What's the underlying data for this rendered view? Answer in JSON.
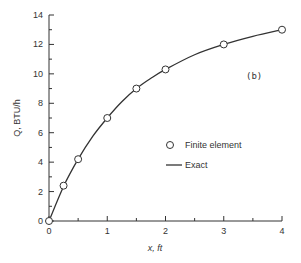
{
  "chart_data": {
    "type": "line",
    "title": "",
    "annotation": "(b)",
    "xlabel": "x, ft",
    "ylabel": "Q, BTU/h",
    "xlim": [
      0,
      4
    ],
    "ylim": [
      0,
      14
    ],
    "x_ticks": [
      0,
      1,
      2,
      3,
      4
    ],
    "x_minor_ticks": [
      0.5,
      1.5,
      2.5,
      3.5
    ],
    "y_ticks": [
      0,
      2,
      4,
      6,
      8,
      10,
      12,
      14
    ],
    "y_minor_ticks": [
      1,
      3,
      5,
      7,
      9,
      11,
      13
    ],
    "grid": false,
    "legend_position": "center-right",
    "series": [
      {
        "name": "Finite element",
        "style": "open-circle-markers",
        "x": [
          0,
          0.25,
          0.5,
          1,
          1.5,
          2,
          3,
          4
        ],
        "y": [
          0,
          2.4,
          4.2,
          7.0,
          9.0,
          10.3,
          12.0,
          13.0
        ]
      },
      {
        "name": "Exact",
        "style": "solid-line",
        "x": [
          0,
          0.25,
          0.5,
          0.75,
          1,
          1.25,
          1.5,
          1.75,
          2,
          2.5,
          3,
          3.5,
          4
        ],
        "y": [
          0,
          2.35,
          4.2,
          5.75,
          7.0,
          8.1,
          9.0,
          9.7,
          10.3,
          11.3,
          12.0,
          12.55,
          13.0
        ]
      }
    ],
    "legend": [
      {
        "label": "Finite element",
        "marker": "circle"
      },
      {
        "label": "Exact",
        "marker": "line"
      }
    ]
  }
}
